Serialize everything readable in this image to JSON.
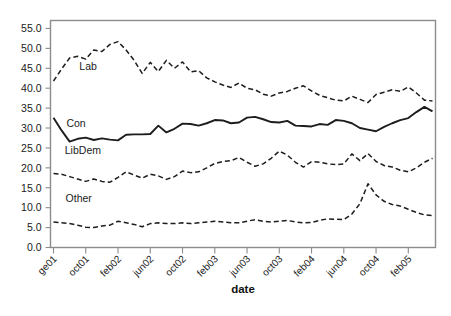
{
  "chart_data": {
    "type": "line",
    "title": "",
    "xlabel": "date",
    "ylabel": "",
    "ylim": [
      0.0,
      57.0
    ],
    "yticks": [
      "0.0",
      "5.0",
      "10.0",
      "15.0",
      "20.0",
      "25.0",
      "30.0",
      "35.0",
      "40.0",
      "45.0",
      "50.0",
      "55.0"
    ],
    "ytick_values": [
      0,
      5,
      10,
      15,
      20,
      25,
      30,
      35,
      40,
      45,
      50,
      55
    ],
    "grid": false,
    "legend": "inline-labels",
    "xticks": [
      "ge01",
      "oct01",
      "feb02",
      "jun02",
      "oct02",
      "feb03",
      "jun03",
      "oct03",
      "feb04",
      "jun04",
      "oct04",
      "feb05"
    ],
    "xtick_index": [
      0,
      4,
      8,
      12,
      16,
      20,
      24,
      28,
      32,
      36,
      40,
      44
    ],
    "x_count": 48,
    "series": [
      {
        "name": "Lab",
        "style": "dashed",
        "color": "#1d1d1d",
        "label_x_index": 3.2,
        "label_y": 44.6,
        "values": [
          41.8,
          44.8,
          47.6,
          48.0,
          47.3,
          49.6,
          49.2,
          51.0,
          51.7,
          49.6,
          47.0,
          43.7,
          46.5,
          44.2,
          47.0,
          45.0,
          46.6,
          44.1,
          44.4,
          42.6,
          41.6,
          40.8,
          40.2,
          41.3,
          40.0,
          39.6,
          38.5,
          38.0,
          38.8,
          39.2,
          40.0,
          40.6,
          39.3,
          38.2,
          37.6,
          37.0,
          36.8,
          38.0,
          37.2,
          36.4,
          38.4,
          39.0,
          39.6,
          39.2,
          40.3,
          38.8,
          37.0,
          36.8
        ]
      },
      {
        "name": "Con",
        "style": "solid",
        "color": "#1d1d1d",
        "label_x_index": 1.6,
        "label_y": 30.2,
        "values": [
          32.6,
          29.4,
          26.6,
          27.3,
          27.6,
          27.0,
          27.4,
          27.1,
          26.9,
          28.3,
          28.4,
          28.4,
          28.5,
          30.6,
          28.9,
          29.8,
          31.1,
          31.0,
          30.6,
          31.2,
          32.0,
          31.9,
          31.2,
          31.4,
          32.6,
          32.8,
          32.2,
          31.5,
          31.4,
          31.8,
          30.6,
          30.5,
          30.4,
          31.0,
          30.8,
          32.0,
          31.8,
          31.2,
          30.0,
          29.6,
          29.2,
          30.3,
          31.2,
          32.0,
          32.5,
          34.0,
          35.3,
          34.2
        ]
      },
      {
        "name": "LibDem",
        "style": "dashed",
        "color": "#1d1d1d",
        "label_x_index": 1.4,
        "label_y": 23.4,
        "values": [
          18.6,
          18.4,
          17.8,
          17.2,
          16.6,
          17.2,
          16.6,
          16.4,
          17.6,
          19.0,
          18.2,
          17.4,
          18.4,
          18.0,
          17.1,
          17.8,
          19.2,
          18.8,
          19.0,
          20.0,
          21.1,
          21.6,
          21.8,
          22.6,
          21.4,
          20.4,
          21.0,
          22.4,
          24.2,
          23.2,
          21.4,
          20.2,
          21.6,
          21.4,
          21.0,
          20.8,
          21.0,
          23.5,
          21.8,
          23.6,
          21.6,
          20.6,
          20.2,
          19.4,
          19.0,
          20.0,
          21.4,
          22.4
        ]
      },
      {
        "name": "Other",
        "style": "dashed",
        "color": "#1d1d1d",
        "label_x_index": 1.5,
        "label_y": 11.3,
        "values": [
          6.4,
          6.2,
          6.0,
          5.6,
          5.1,
          5.0,
          5.4,
          5.6,
          6.6,
          6.2,
          5.8,
          5.2,
          6.0,
          6.2,
          6.0,
          6.0,
          6.2,
          6.0,
          6.2,
          6.4,
          6.6,
          6.4,
          6.2,
          6.2,
          6.6,
          7.0,
          6.6,
          6.4,
          6.6,
          6.8,
          6.4,
          6.2,
          6.3,
          6.8,
          7.2,
          7.1,
          7.0,
          8.4,
          11.0,
          16.0,
          13.2,
          11.6,
          10.8,
          10.4,
          9.6,
          8.8,
          8.2,
          8.0
        ]
      }
    ]
  },
  "caption": {
    "line": ""
  }
}
